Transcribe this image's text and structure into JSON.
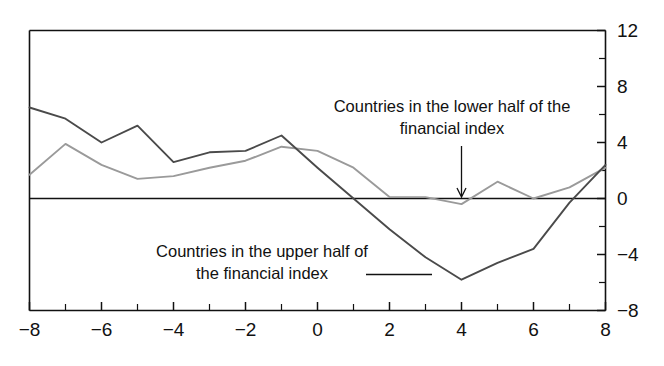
{
  "chart_data": {
    "type": "line",
    "title": "",
    "subtitle": "",
    "xlabel": "",
    "ylabel": "",
    "xlim": [
      -8,
      8
    ],
    "ylim": [
      -8,
      12
    ],
    "grid": false,
    "legend_position": "inline-annotations",
    "x_ticks_major": [
      -8,
      -6,
      -4,
      -2,
      0,
      2,
      4,
      6,
      8
    ],
    "x_tick_labels": [
      "−8",
      "−6",
      "−4",
      "−2",
      "0",
      "2",
      "4",
      "6",
      "8"
    ],
    "x_ticks_minor": [
      -7,
      -5,
      -3,
      -1,
      1,
      3,
      5,
      7
    ],
    "y_ticks_major": [
      -8,
      -4,
      0,
      4,
      8,
      12
    ],
    "y_tick_labels": [
      "−8",
      "−4",
      "0",
      "4",
      "8",
      "12"
    ],
    "y_ticks_minor": [
      -6,
      -2,
      2,
      6,
      10
    ],
    "x": [
      -8,
      -7,
      -6,
      -5,
      -4,
      -3,
      -2,
      -1,
      0,
      1,
      2,
      3,
      4,
      5,
      6,
      7,
      8
    ],
    "series": [
      {
        "name": "Countries in the upper half of the financial index",
        "color": "#4a4a4a",
        "values": [
          6.5,
          5.7,
          4.0,
          5.2,
          2.6,
          3.3,
          3.4,
          4.5,
          2.2,
          0.0,
          -2.2,
          -4.2,
          -5.8,
          -4.6,
          -3.6,
          -0.3,
          2.4
        ]
      },
      {
        "name": "Countries in the lower half of the financial index",
        "color": "#9a9a9a",
        "values": [
          1.7,
          3.9,
          2.4,
          1.4,
          1.6,
          2.2,
          2.7,
          3.7,
          3.4,
          2.2,
          0.1,
          0.1,
          -0.4,
          1.2,
          0.0,
          0.8,
          2.2
        ]
      }
    ],
    "annotations": [
      {
        "id": "lower-half-annotation",
        "line1": "Countries in the lower half of the",
        "line2": "financial index",
        "leader": "vertical-arrow-down",
        "points_to_x": 4,
        "points_to_y": 0
      },
      {
        "id": "upper-half-annotation",
        "line1": "Countries in the upper half of",
        "line2": "the financial index",
        "leader": "horizontal-line-right",
        "points_to_x": 3,
        "points_to_y": -4.4
      }
    ]
  }
}
